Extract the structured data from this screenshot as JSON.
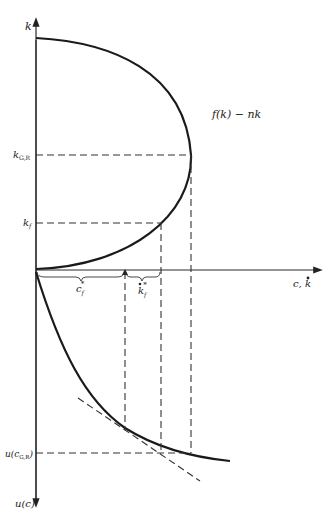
{
  "diagram": {
    "type": "phase-diagram",
    "colors": {
      "ink": "#1a1a1a",
      "background": "#ffffff"
    },
    "axes": {
      "vertical_up_label": "k",
      "vertical_down_label": "u(c)",
      "horizontal_label_c": "c,",
      "horizontal_label_k": "k",
      "horizontal_label_k_dot": "•"
    },
    "curves": {
      "upper_curve_label": "f(k) − nk",
      "lower_curve": "u(c)",
      "tangent": "tangent-line"
    },
    "levels": {
      "k_gr": {
        "main": "k",
        "sub": "G,R"
      },
      "k_f": {
        "main": "k",
        "sub": "f"
      },
      "u_c_gr": {
        "prefix": "u(c",
        "sub": "G,R",
        "suffix": ")"
      }
    },
    "braces": {
      "c_f_star": {
        "main": "c",
        "sub": "f",
        "sup": "*"
      },
      "k_f_star": {
        "main": "k",
        "sub": "f",
        "sup": "*",
        "dot": "•"
      }
    }
  }
}
